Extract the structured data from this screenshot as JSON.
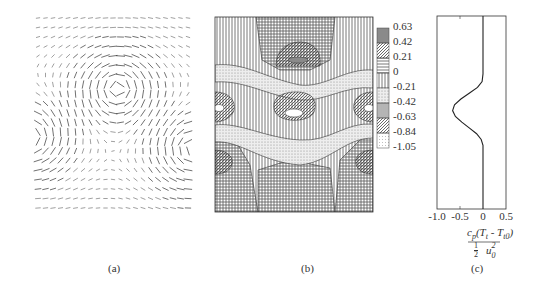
{
  "figure": {
    "panels": [
      {
        "id": "a",
        "label": "(a)",
        "kind": "vector-field",
        "description": "velocity vectors showing staggered vortex street: one vortex at upper-middle, two vortices at lower-left and lower-right edges"
      },
      {
        "id": "b",
        "label": "(b)",
        "kind": "filled-contour",
        "description": "hatched contour map of temperature field"
      },
      {
        "id": "c",
        "label": "(c)",
        "kind": "line-profile"
      }
    ],
    "legend": {
      "levels": [
        "0.63",
        "0.42",
        "0.21",
        "0",
        "-0.21",
        "-0.42",
        "-0.63",
        "-0.84",
        "-1.05"
      ],
      "patterns": [
        "dark-fill",
        "diagonal-hatch",
        "horizontal-lines",
        "vertical-lines",
        "dotted",
        "dense-vertical-lines",
        "diagonal-hatch",
        "light-dotted"
      ]
    }
  },
  "chart_data": {
    "type": "line",
    "title": "",
    "xlabel_numerator": "c_p(T_t - T_t0)",
    "xlabel_denominator": "1/2 u_0^2",
    "ylabel": "",
    "xlim": [
      -1.0,
      0.5
    ],
    "ylim": [
      0,
      1
    ],
    "x_ticks": [
      "-1.0",
      "-0.5",
      "0",
      "0.5"
    ],
    "grid": false,
    "series": [
      {
        "name": "profile",
        "y": [
          0,
          0.1,
          0.2,
          0.3,
          0.34,
          0.37,
          0.4,
          0.43,
          0.46,
          0.49,
          0.52,
          0.55,
          0.58,
          0.61,
          0.64,
          0.67,
          0.7,
          0.8,
          0.9,
          1.0
        ],
        "x": [
          0,
          0,
          0,
          0,
          -0.02,
          -0.12,
          -0.3,
          -0.48,
          -0.62,
          -0.66,
          -0.6,
          -0.46,
          -0.3,
          -0.14,
          -0.04,
          0,
          0,
          0,
          0,
          0
        ]
      }
    ]
  },
  "labels": {
    "a": "(a)",
    "b": "(b)",
    "c": "(c)",
    "frac_num_cp": "c",
    "frac_num_p": "p",
    "frac_num_rest": "(T",
    "frac_num_t": "t",
    "frac_num_mid": " - T",
    "frac_num_t0": "t0",
    "frac_num_close": ")",
    "frac_den_half": "1",
    "frac_den_two": "2",
    "frac_den_u": "u",
    "frac_den_sup": "2",
    "frac_den_sub": "0"
  }
}
